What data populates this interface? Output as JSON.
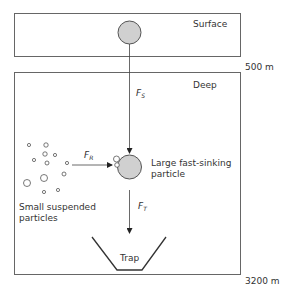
{
  "diagram": {
    "zones": {
      "surface": {
        "label": "Surface"
      },
      "deep": {
        "label": "Deep"
      }
    },
    "depths": {
      "upper": "500 m",
      "lower": "3200 m"
    },
    "fluxes": {
      "sinking": {
        "symbol": "F",
        "subscript": "S"
      },
      "removal": {
        "symbol": "F",
        "subscript": "R"
      },
      "trap": {
        "symbol": "F",
        "subscript": "T"
      }
    },
    "labels": {
      "large_particle_line1": "Large fast-sinking",
      "large_particle_line2": "particle",
      "small_particles_line1": "Small suspended",
      "small_particles_line2": "particles",
      "trap": "Trap"
    },
    "colors": {
      "particle_fill": "#d0d0d0",
      "stroke": "#555555"
    }
  }
}
